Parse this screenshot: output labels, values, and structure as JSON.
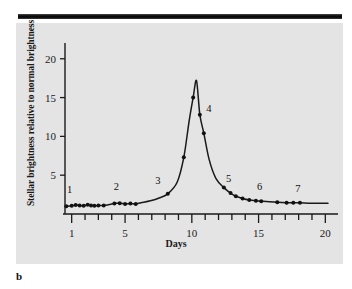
{
  "figure": {
    "letter": "b",
    "background_color": "#e4e4e4",
    "rule_color": "#111111",
    "line_color": "#1a1a1a",
    "marker_color": "#111111"
  },
  "chart_data": {
    "type": "line",
    "title": "",
    "subtitle": "",
    "xlabel": "Days",
    "ylabel": "Stellar brightness relative to normal brightness",
    "xlim": [
      0.5,
      20.5
    ],
    "ylim": [
      0,
      21
    ],
    "xticks": [
      1,
      2,
      3,
      4,
      5,
      6,
      7,
      8,
      9,
      10,
      11,
      12,
      13,
      14,
      15,
      16,
      17,
      18,
      19,
      20
    ],
    "xtick_labels": [
      "1",
      "",
      "",
      "",
      "5",
      "",
      "",
      "",
      "",
      "10",
      "",
      "",
      "",
      "",
      "15",
      "",
      "",
      "",
      "",
      "20"
    ],
    "yticks": [
      5,
      10,
      15,
      20
    ],
    "ytick_labels": [
      "5",
      "10",
      "15",
      "20"
    ],
    "grid": false,
    "legend": "none",
    "series": [
      {
        "name": "Nova light curve",
        "x": [
          0.6,
          1.0,
          1.3,
          1.6,
          1.9,
          2.2,
          2.45,
          2.7,
          3.0,
          3.4,
          4.2,
          4.6,
          5.0,
          5.4,
          5.8,
          6.2,
          6.9,
          7.6,
          8.2,
          8.9,
          9.4,
          9.8,
          10.1,
          10.35,
          10.6,
          10.9,
          11.3,
          11.8,
          12.4,
          12.9,
          13.3,
          13.8,
          14.3,
          14.8,
          15.2,
          15.6,
          16.4,
          17.1,
          17.6,
          18.1,
          19.0,
          20.2
        ],
        "y": [
          1.0,
          1.05,
          1.15,
          1.1,
          1.05,
          1.2,
          1.1,
          1.05,
          1.1,
          1.1,
          1.35,
          1.4,
          1.3,
          1.35,
          1.3,
          1.45,
          1.7,
          2.1,
          2.6,
          4.1,
          7.3,
          12.0,
          15.0,
          17.2,
          12.8,
          10.4,
          7.0,
          4.6,
          3.4,
          2.7,
          2.3,
          2.0,
          1.8,
          1.7,
          1.65,
          1.6,
          1.5,
          1.45,
          1.45,
          1.45,
          1.4,
          1.4
        ]
      }
    ],
    "markers": {
      "x": [
        0.6,
        1.0,
        1.3,
        1.6,
        1.9,
        2.2,
        2.45,
        2.7,
        3.0,
        3.4,
        4.2,
        4.6,
        5.0,
        5.4,
        5.8,
        8.2,
        9.4,
        10.1,
        10.6,
        10.9,
        12.4,
        12.9,
        13.3,
        13.8,
        14.3,
        14.8,
        15.2,
        16.4,
        17.1,
        17.6,
        18.1
      ],
      "y": [
        1.0,
        1.05,
        1.15,
        1.1,
        1.05,
        1.2,
        1.1,
        1.05,
        1.1,
        1.1,
        1.35,
        1.4,
        1.3,
        1.35,
        1.3,
        2.6,
        7.3,
        15.0,
        12.8,
        10.4,
        3.4,
        2.7,
        2.3,
        2.0,
        1.8,
        1.7,
        1.65,
        1.5,
        1.45,
        1.45,
        1.45
      ]
    },
    "annotations": [
      {
        "label": "1",
        "x": 1.0,
        "y": 1.05,
        "dx": -2,
        "dy": -13
      },
      {
        "label": "2",
        "x": 4.5,
        "y": 1.4,
        "dx": -2,
        "dy": -13
      },
      {
        "label": "3",
        "x": 8.2,
        "y": 2.6,
        "dx": -10,
        "dy": -10
      },
      {
        "label": "4",
        "x": 10.6,
        "y": 12.8,
        "dx": 9,
        "dy": -3
      },
      {
        "label": "5",
        "x": 12.9,
        "y": 2.7,
        "dx": -2,
        "dy": -11
      },
      {
        "label": "6",
        "x": 15.0,
        "y": 1.7,
        "dx": 1,
        "dy": -11
      },
      {
        "label": "7",
        "x": 17.8,
        "y": 1.45,
        "dx": 2,
        "dy": -11
      }
    ]
  }
}
